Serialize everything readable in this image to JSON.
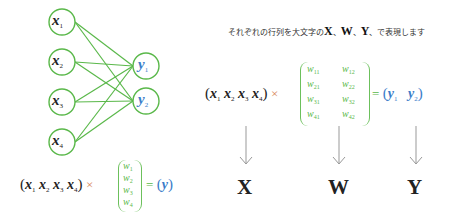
{
  "colors": {
    "node_stroke": "#5ab84a",
    "edge": "#5ab84a",
    "x_text": "#222222",
    "y_text": "#3a7cc9",
    "weights": "#5ab84a",
    "times": "#d98a5a",
    "arrow": "#999999"
  },
  "network": {
    "inputs": [
      {
        "var": "x",
        "sub": "1"
      },
      {
        "var": "x",
        "sub": "2"
      },
      {
        "var": "x",
        "sub": "3"
      },
      {
        "var": "x",
        "sub": "4"
      }
    ],
    "outputs": [
      {
        "var": "y",
        "sub": "1"
      },
      {
        "var": "y",
        "sub": "2"
      }
    ]
  },
  "left_equation": {
    "open_paren": "(",
    "x": [
      {
        "var": "x",
        "sub": "1"
      },
      {
        "var": "x",
        "sub": "2"
      },
      {
        "var": "x",
        "sub": "3"
      },
      {
        "var": "x",
        "sub": "4"
      }
    ],
    "close_paren": ")",
    "times": "×",
    "w": [
      {
        "var": "w",
        "sub": "1"
      },
      {
        "var": "w",
        "sub": "2"
      },
      {
        "var": "w",
        "sub": "3"
      },
      {
        "var": "w",
        "sub": "4"
      }
    ],
    "equals": "=",
    "result_open": "(",
    "result_var": "y",
    "result_close": ")"
  },
  "heading": {
    "prefix": "それぞれの行列を大文字の",
    "X": "X",
    "sep1": "、",
    "W": "W",
    "sep2": "、",
    "Y": "Y",
    "suffix": "、で表現します"
  },
  "matrix_equation": {
    "open_paren": "(",
    "x": [
      {
        "var": "x",
        "sub": "1"
      },
      {
        "var": "x",
        "sub": "2"
      },
      {
        "var": "x",
        "sub": "3"
      },
      {
        "var": "x",
        "sub": "4"
      }
    ],
    "close_paren": ")",
    "times": "×",
    "w": [
      [
        {
          "var": "w",
          "sub": "11"
        },
        {
          "var": "w",
          "sub": "12"
        }
      ],
      [
        {
          "var": "w",
          "sub": "21"
        },
        {
          "var": "w",
          "sub": "22"
        }
      ],
      [
        {
          "var": "w",
          "sub": "31"
        },
        {
          "var": "w",
          "sub": "32"
        }
      ],
      [
        {
          "var": "w",
          "sub": "41"
        },
        {
          "var": "w",
          "sub": "42"
        }
      ]
    ],
    "equals": "=",
    "result_open": "(",
    "y": [
      {
        "var": "y",
        "sub": "1"
      },
      {
        "var": "y",
        "sub": "2"
      }
    ],
    "result_close": ")"
  },
  "labels": {
    "X": "X",
    "W": "W",
    "Y": "Y"
  }
}
